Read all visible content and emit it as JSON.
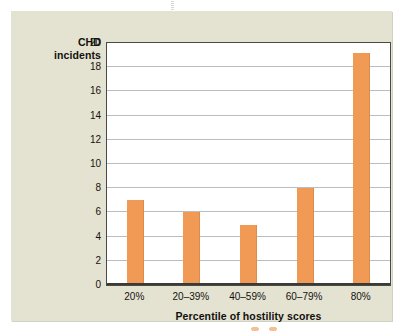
{
  "figure": {
    "panel_color": "#e4e3d1",
    "plot_background": "#ffffff",
    "bar_color": "#f09a55",
    "gridline_color": "#b9bcc0",
    "axis_color": "#3a3a36",
    "text_color": "#15120f"
  },
  "chart_data": {
    "type": "bar",
    "title": "",
    "subtitle": "",
    "xlabel": "Percentile of hostility scores",
    "ylabel": "CHD incidents",
    "ylabel_lines": [
      "CHD",
      "incidents"
    ],
    "categories": [
      "20%",
      "20–39%",
      "40–59%",
      "60–79%",
      "80%"
    ],
    "values": [
      7,
      6,
      5,
      8,
      19.2
    ],
    "ylim": [
      0,
      20
    ],
    "ytick_labels": [
      "0",
      "2",
      "4",
      "6",
      "8",
      "10",
      "12",
      "14",
      "16",
      "18",
      "20"
    ],
    "ytick_values": [
      0,
      2,
      4,
      6,
      8,
      10,
      12,
      14,
      16,
      18,
      20
    ],
    "grid": "horizontal",
    "legend": "none",
    "annotations": []
  }
}
